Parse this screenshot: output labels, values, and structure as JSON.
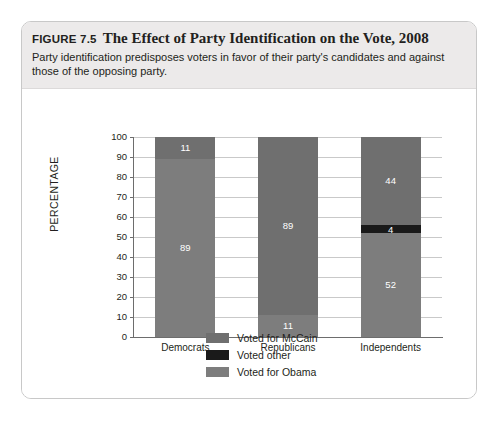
{
  "figure": {
    "number": "FIGURE 7.5",
    "title": "The Effect of Party Identification on the Vote, 2008",
    "subtitle": "Party identification predisposes voters in favor of their party's candidates and against those of the opposing party."
  },
  "colors": {
    "mccain": "#6f6f6f",
    "other": "#1a1a1a",
    "obama": "#7d7d7d",
    "axis": "#6d6d6d",
    "gridline": "#c9c9c9",
    "header_band": "#eceaea",
    "card_border": "#c8c8c8",
    "text": "#231f20"
  },
  "chart_data": {
    "type": "bar",
    "stacked": true,
    "title": "The Effect of Party Identification on the Vote, 2008",
    "xlabel": "",
    "ylabel": "PERCENTAGE",
    "ylim": [
      0,
      100
    ],
    "ytick_step": 10,
    "yticks": [
      "100",
      "90",
      "80",
      "70",
      "60",
      "50",
      "40",
      "30",
      "20",
      "10",
      "0"
    ],
    "grid": true,
    "legend_position": "bottom-center",
    "categories": [
      "Democrats",
      "Republicans",
      "Independents"
    ],
    "series": [
      {
        "name": "Voted for McCain",
        "color": "#6f6f6f",
        "values": [
          11,
          89,
          44
        ]
      },
      {
        "name": "Voted other",
        "color": "#1a1a1a",
        "values": [
          0,
          0,
          4
        ]
      },
      {
        "name": "Voted for Obama",
        "color": "#7d7d7d",
        "values": [
          89,
          11,
          52
        ]
      }
    ],
    "bars": [
      {
        "category": "Democrats",
        "segments": [
          {
            "series": "Voted for McCain",
            "value": 11,
            "label": "11",
            "show_label": true
          },
          {
            "series": "Voted other",
            "value": 0,
            "label": "",
            "show_label": false
          },
          {
            "series": "Voted for Obama",
            "value": 89,
            "label": "89",
            "show_label": true
          }
        ]
      },
      {
        "category": "Republicans",
        "segments": [
          {
            "series": "Voted for McCain",
            "value": 89,
            "label": "89",
            "show_label": true
          },
          {
            "series": "Voted other",
            "value": 0,
            "label": "",
            "show_label": false
          },
          {
            "series": "Voted for Obama",
            "value": 11,
            "label": "11",
            "show_label": true
          }
        ]
      },
      {
        "category": "Independents",
        "segments": [
          {
            "series": "Voted for McCain",
            "value": 44,
            "label": "44",
            "show_label": true
          },
          {
            "series": "Voted other",
            "value": 4,
            "label": "4",
            "show_label": true
          },
          {
            "series": "Voted for Obama",
            "value": 52,
            "label": "52",
            "show_label": true
          }
        ]
      }
    ],
    "legend": [
      {
        "label": "Voted for McCain",
        "color": "#6f6f6f"
      },
      {
        "label": "Voted other",
        "color": "#1a1a1a"
      },
      {
        "label": "Voted for Obama",
        "color": "#7d7d7d"
      }
    ]
  }
}
